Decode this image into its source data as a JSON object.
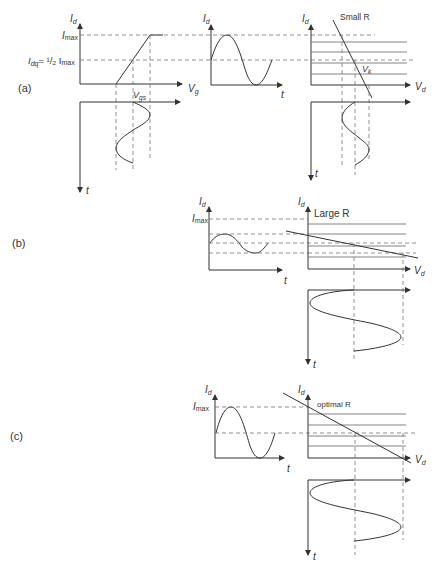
{
  "figure": {
    "panels": [
      {
        "id": "a",
        "label": "(a)",
        "load_label": "Small R",
        "transfer": {
          "y_axis": "I",
          "y_sub": "d",
          "x_axis": "V",
          "x_sub": "g",
          "imax": "I",
          "imax_sub": "max",
          "idq": "I",
          "idq_sub": "dq",
          "idq_eq": "= ¹/₂ I",
          "idq_eq_sub": "max",
          "vgs": "V",
          "vgs_sub": "gs"
        },
        "input_wave_t": "t",
        "output_wave": {
          "y_axis": "I",
          "y_sub": "d",
          "x_axis": "t"
        },
        "output_char": {
          "y_axis": "I",
          "y_sub": "d",
          "x_axis": "V",
          "x_sub": "d",
          "vk": "V",
          "vk_sub": "k"
        },
        "output_voltage_t": "t"
      },
      {
        "id": "b",
        "label": "(b)",
        "load_label": "Large R",
        "output_wave": {
          "y_axis": "I",
          "y_sub": "d",
          "imax": "I",
          "imax_sub": "max",
          "x_axis": "t"
        },
        "output_char": {
          "y_axis": "I",
          "y_sub": "d",
          "x_axis": "V",
          "x_sub": "d"
        },
        "output_voltage_t": "t"
      },
      {
        "id": "c",
        "label": "(c)",
        "load_label": "optimal R",
        "output_wave": {
          "y_axis": "I",
          "y_sub": "d",
          "imax": "I",
          "imax_sub": "max",
          "x_axis": "t"
        },
        "output_char": {
          "y_axis": "I",
          "y_sub": "d",
          "x_axis": "V",
          "x_sub": "d"
        },
        "output_voltage_t": "t"
      }
    ]
  }
}
